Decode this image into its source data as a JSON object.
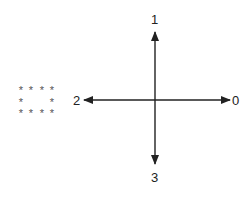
{
  "diagram": {
    "type": "direction-axes",
    "center": {
      "x": 155,
      "y": 100
    },
    "stroke_color": "#222222",
    "arrows": [
      {
        "direction": "right",
        "label": "0"
      },
      {
        "direction": "up",
        "label": "1"
      },
      {
        "direction": "left",
        "label": "2"
      },
      {
        "direction": "down",
        "label": "3"
      }
    ],
    "star_box": {
      "glyph": "*",
      "rows": [
        "****",
        "*  *",
        "****"
      ]
    }
  }
}
